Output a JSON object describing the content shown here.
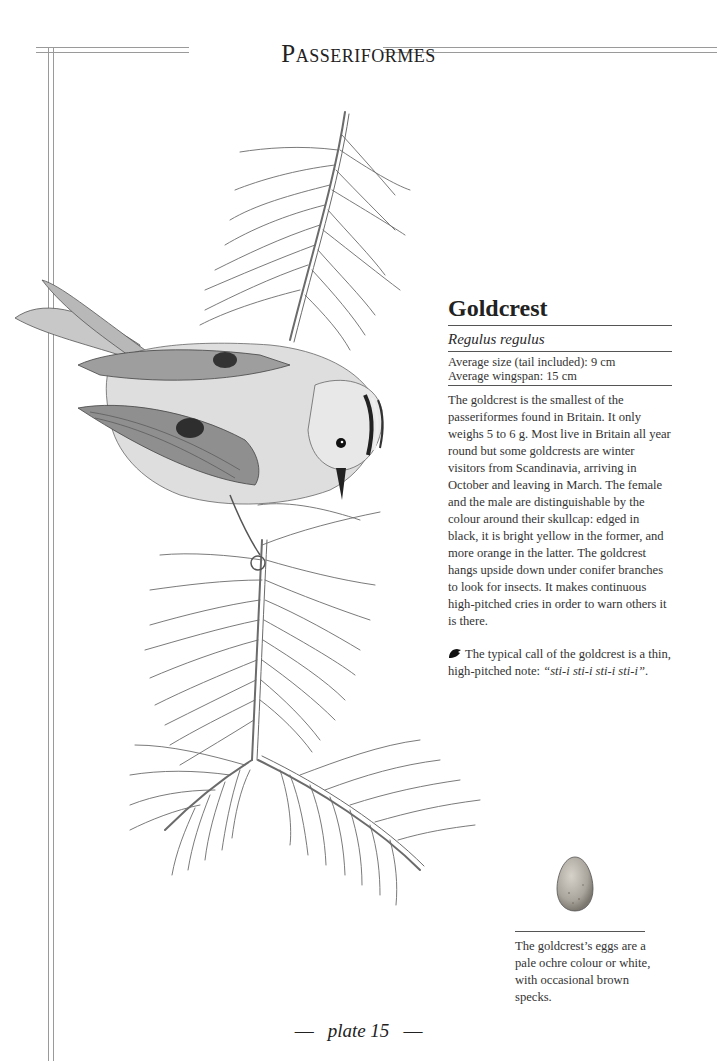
{
  "header": {
    "title": "Passeriformes"
  },
  "species": {
    "common_name": "Goldcrest",
    "latin_name": "Regulus regulus",
    "average_size": "Average size (tail included): 9 cm",
    "average_wingspan": "Average wingspan: 15 cm",
    "description": "The goldcrest is the smallest of the passeriformes found in Britain. It only weighs 5 to 6 g. Most live in Britain all year round but some goldcrests are winter visitors from Scandinavia, arriving in October and leaving in March. The female and the male are distinguishable by the colour around their skullcap: edged in black, it is bright yellow in the former, and more orange in the latter. The goldcrest hangs upside down under conifer branches to look for insects. It makes continuous high-pitched cries in order to warn others it is there.",
    "call": {
      "icon": "bird-head-icon",
      "intro": "The typical call of the goldcrest is a thin, high-pitched note: ",
      "words": "“sti-i sti-i sti-i sti-i”",
      "end": "."
    }
  },
  "egg": {
    "caption": "The goldcrest’s eggs are a pale ochre colour or white, with occasional brown specks.",
    "colors": {
      "base": "#b9b4aa",
      "shade": "#8a857c"
    }
  },
  "illustration": {
    "subject": "goldcrest perched upside down on conifer branch",
    "colors": {
      "line": "#6b6b6b",
      "feather_dark": "#3a3a3a",
      "body": "#d9d9d9"
    }
  },
  "footer": {
    "dash_left": "—",
    "plate": "plate 15",
    "dash_right": "—"
  }
}
